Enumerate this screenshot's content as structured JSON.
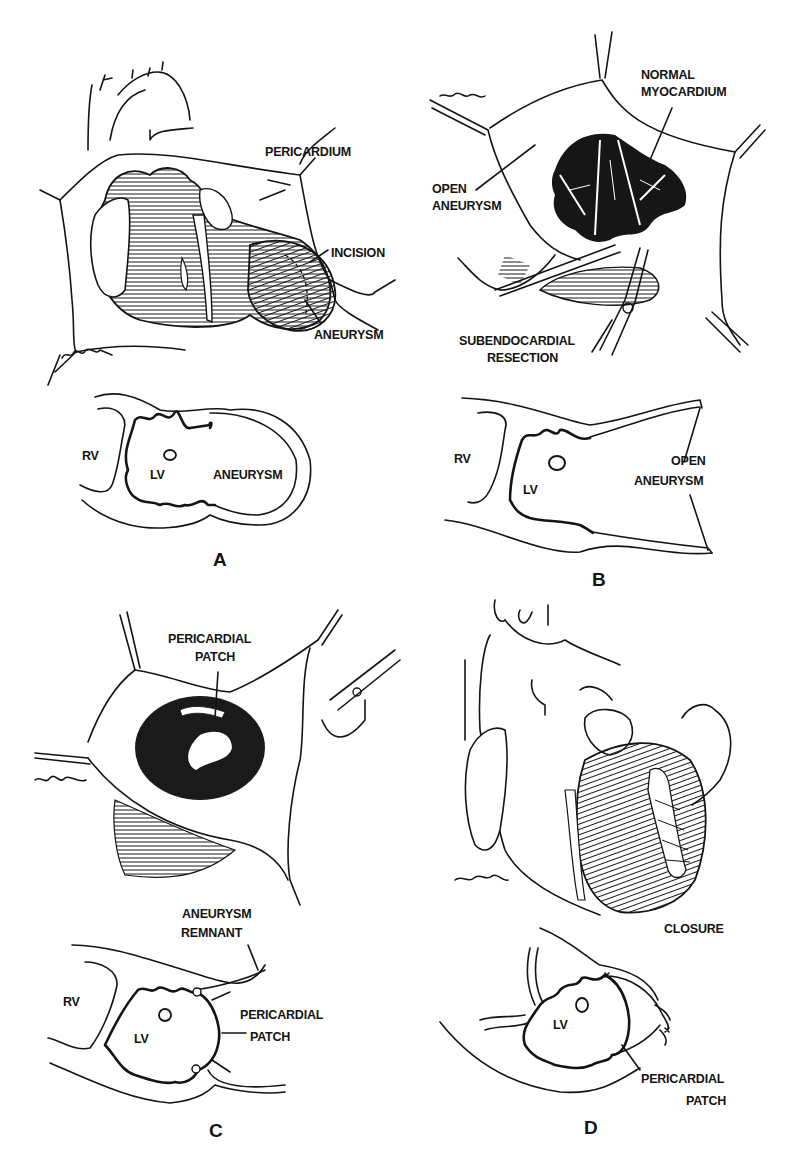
{
  "figure": {
    "panels": [
      {
        "id": "A",
        "letter": "A",
        "illustration": {
          "labels": [
            "PERICARDIUM",
            "INCISION",
            "ANEURYSM"
          ],
          "signature": "Greenfield"
        },
        "cross_section": {
          "labels": [
            "RV",
            "LV",
            "ANEURYSM"
          ]
        }
      },
      {
        "id": "B",
        "letter": "B",
        "illustration": {
          "labels": [
            "NORMAL",
            "MYOCARDIUM",
            "OPEN",
            "ANEURYSM",
            "SUBENDOCARDIAL",
            "RESECTION"
          ],
          "signature": "Greenfield"
        },
        "cross_section": {
          "labels": [
            "RV",
            "LV",
            "OPEN",
            "ANEURYSM"
          ]
        }
      },
      {
        "id": "C",
        "letter": "C",
        "illustration": {
          "labels": [
            "PERICARDIAL",
            "PATCH"
          ],
          "signature": "Greenfield"
        },
        "cross_section": {
          "labels": [
            "ANEURYSM",
            "REMNANT",
            "RV",
            "LV",
            "PERICARDIAL",
            "PATCH"
          ]
        }
      },
      {
        "id": "D",
        "letter": "D",
        "illustration": {
          "labels": [
            "CLOSURE"
          ],
          "signature": "Greenfield"
        },
        "cross_section": {
          "labels": [
            "LV",
            "PERICARDIAL",
            "PATCH"
          ]
        }
      }
    ]
  }
}
